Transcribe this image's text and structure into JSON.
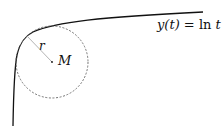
{
  "diagram": {
    "equation": {
      "lhs": "y(t)",
      "eq": " = ",
      "fn": "ln",
      "arg": " t"
    },
    "labels": {
      "radius": "r",
      "center": "M"
    },
    "colors": {
      "curve": "#111111",
      "circle": "#666666",
      "radius_line": "#999999",
      "background": "#ffffff"
    },
    "elements": [
      "curve y(t) = ln t",
      "dashed osculating circle",
      "radius segment r",
      "center point M"
    ]
  }
}
